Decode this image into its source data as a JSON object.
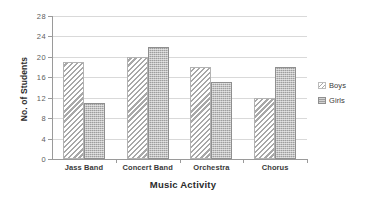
{
  "chart_data": {
    "type": "bar",
    "title": "",
    "categories": [
      "Jass Band",
      "Concert Band",
      "Orchestra",
      "Chorus"
    ],
    "series": [
      {
        "name": "Boys",
        "values": [
          19,
          20,
          18,
          12
        ],
        "pattern": "diagonal-hatch",
        "color": "#a8a8a8"
      },
      {
        "name": "Girls",
        "values": [
          11,
          22,
          15,
          18
        ],
        "pattern": "dotted-fill",
        "color": "#9e9e9e"
      }
    ],
    "xlabel": "Music Activity",
    "ylabel": "No. of Students",
    "ylim": [
      0,
      28
    ],
    "ytick_step": 4,
    "yticks": [
      0,
      4,
      8,
      12,
      16,
      20,
      24,
      28
    ],
    "ytick_labels": [
      "0",
      "4",
      "8",
      "12",
      "16",
      "20",
      "24",
      "28"
    ],
    "grid": "horizontal",
    "legend_position": "right"
  },
  "axes": {
    "y_title": "No. of Students",
    "x_title": "Music Activity"
  },
  "legend": {
    "items": [
      {
        "label": "Boys",
        "swatch": "hatch-swatch-icon"
      },
      {
        "label": "Girls",
        "swatch": "dotted-swatch-icon"
      }
    ]
  }
}
